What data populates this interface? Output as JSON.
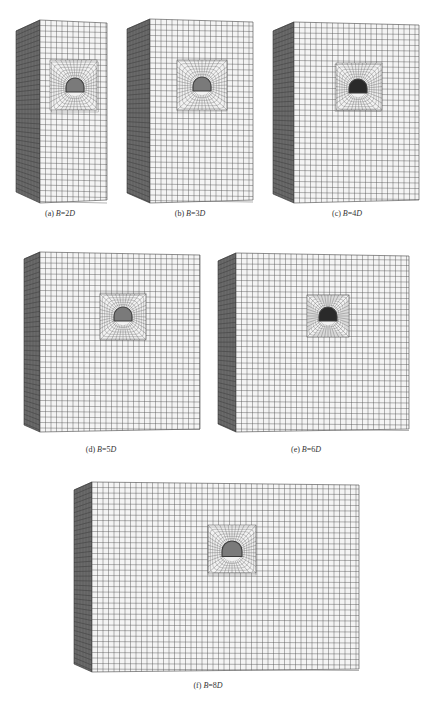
{
  "figure": {
    "panels": [
      {
        "id": "a",
        "label": "(a)",
        "b_var": "B",
        "eq": "=",
        "value": "2",
        "d_var": "D",
        "box": {
          "side_x": 16,
          "front_x": 40,
          "front_w": 67,
          "top": 20,
          "bottom": 203
        },
        "refine": {
          "x": 50,
          "y": 60,
          "w": 47,
          "h": 50
        },
        "tunnel": {
          "cx": 75,
          "cy": 87,
          "r": 9
        },
        "caption_x": 60,
        "caption_y": 214
      },
      {
        "id": "b",
        "label": "(b)",
        "b_var": "B",
        "eq": "=",
        "value": "3",
        "d_var": "D",
        "box": {
          "side_x": 127,
          "front_x": 150,
          "front_w": 103,
          "top": 19,
          "bottom": 203
        },
        "refine": {
          "x": 177,
          "y": 60,
          "w": 50,
          "h": 50
        },
        "tunnel": {
          "cx": 202,
          "cy": 86,
          "r": 9
        },
        "caption_x": 190,
        "caption_y": 214
      },
      {
        "id": "c",
        "label": "(c)",
        "b_var": "B",
        "eq": "=",
        "value": "4",
        "d_var": "D",
        "box": {
          "side_x": 273,
          "front_x": 294,
          "front_w": 125,
          "top": 22,
          "bottom": 203
        },
        "refine": {
          "x": 336,
          "y": 63,
          "w": 46,
          "h": 47
        },
        "tunnel": {
          "cx": 358,
          "cy": 88,
          "r": 9
        },
        "caption_x": 347,
        "caption_y": 214
      },
      {
        "id": "d",
        "label": "(d)",
        "b_var": "B",
        "eq": "=",
        "value": "5",
        "d_var": "D",
        "box": {
          "side_x": 24,
          "front_x": 40,
          "front_w": 160,
          "top": 252,
          "bottom": 432
        },
        "refine": {
          "x": 100,
          "y": 294,
          "w": 46,
          "h": 46
        },
        "tunnel": {
          "cx": 123,
          "cy": 316,
          "r": 9
        },
        "caption_x": 101,
        "caption_y": 450
      },
      {
        "id": "e",
        "label": "(e)",
        "b_var": "B",
        "eq": "=",
        "value": "6",
        "d_var": "D",
        "box": {
          "side_x": 218,
          "front_x": 236,
          "front_w": 173,
          "top": 253,
          "bottom": 432
        },
        "refine": {
          "x": 307,
          "y": 295,
          "w": 42,
          "h": 42
        },
        "tunnel": {
          "cx": 328,
          "cy": 316,
          "r": 9
        },
        "caption_x": 306,
        "caption_y": 450
      },
      {
        "id": "f",
        "label": "(f)",
        "b_var": "B",
        "eq": "=",
        "value": "8",
        "d_var": "D",
        "box": {
          "side_x": 74,
          "front_x": 92,
          "front_w": 267,
          "top": 482,
          "bottom": 672
        },
        "refine": {
          "x": 208,
          "y": 525,
          "w": 48,
          "h": 48
        },
        "tunnel": {
          "cx": 232,
          "cy": 551,
          "r": 10
        },
        "caption_x": 208,
        "caption_y": 686
      }
    ],
    "caption": "",
    "colors": {
      "mesh_line": "#555555",
      "front_face": "#f4f4f4",
      "side_face": "#6a6a6a",
      "tunnel": "#3a3a3a"
    },
    "mesh_cell": 5.5
  }
}
